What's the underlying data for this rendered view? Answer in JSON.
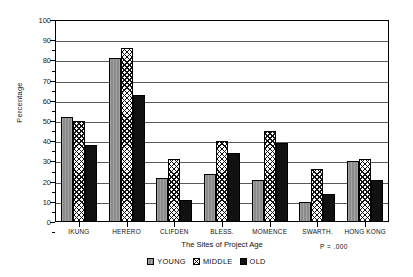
{
  "chart_data": {
    "type": "bar",
    "title": "",
    "xlabel": "The Sites of Project Age",
    "ylabel": "Percentage",
    "ylim": [
      0,
      100
    ],
    "ytick_step": 10,
    "yticks": [
      0,
      10,
      20,
      30,
      40,
      50,
      60,
      70,
      80,
      90,
      100
    ],
    "grid": true,
    "legend_position": "bottom-center",
    "categories": [
      "IKUNG",
      "HERERO",
      "CLIFDEN",
      "BLESS.",
      "MOMENCE",
      "SWARTH.",
      "HONG KONG"
    ],
    "series": [
      {
        "name": "YOUNG",
        "pattern": "solid-gray",
        "color": "#8b8b8b",
        "values": [
          52,
          81,
          22,
          24,
          21,
          10,
          30
        ]
      },
      {
        "name": "MIDDLE",
        "pattern": "cross-hatch",
        "color": "#ffffff",
        "values": [
          50,
          86,
          31,
          40,
          45,
          26,
          31
        ]
      },
      {
        "name": "OLD",
        "pattern": "solid-black",
        "color": "#111111",
        "values": [
          38,
          63,
          11,
          34,
          39,
          14,
          21
        ]
      }
    ],
    "annotations": [
      {
        "name": "p-value",
        "text": "P = .000"
      }
    ]
  },
  "axes": {
    "y_title": "Percentage",
    "x_title": "The Sites of Project Age",
    "y_tick_labels": [
      "100",
      "90",
      "80",
      "70",
      "60",
      "50",
      "40",
      "30",
      "20",
      "10",
      "0"
    ]
  },
  "notes": {
    "p_value": "P = .000"
  },
  "legend": {
    "items": [
      {
        "label": "YOUNG"
      },
      {
        "label": "MIDDLE"
      },
      {
        "label": "OLD"
      }
    ]
  }
}
